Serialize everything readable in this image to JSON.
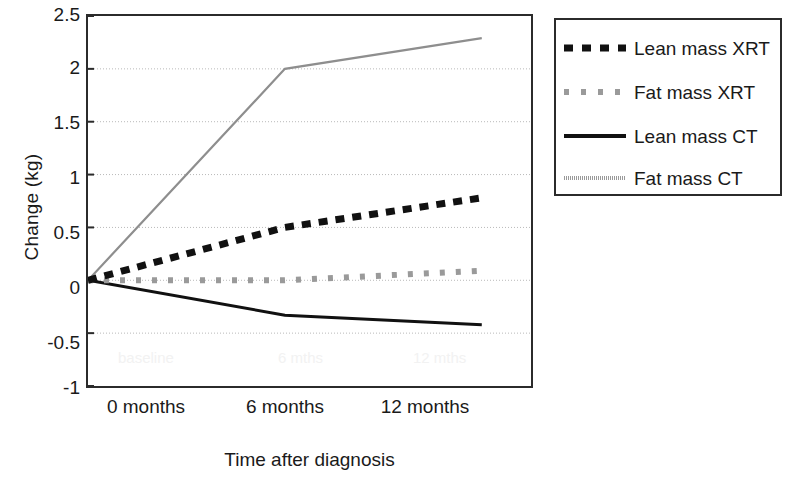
{
  "chart_data": {
    "type": "line",
    "title": "",
    "xlabel": "Time after diagnosis",
    "ylabel": "Change (kg)",
    "x": [
      0,
      6,
      12
    ],
    "categories": [
      "0 months",
      "6 months",
      "12 months"
    ],
    "xtick_labels": [
      "0 months",
      "6 months",
      "12 months"
    ],
    "ytick_labels": [
      "2.5",
      "2",
      "1.5",
      "1",
      "0.5",
      "0",
      "-0.5",
      "-1"
    ],
    "ytick_values": [
      2.5,
      2,
      1.5,
      1,
      0.5,
      0,
      -0.5,
      -1
    ],
    "ylim": [
      -1,
      2.5
    ],
    "xlim": [
      0,
      13.5
    ],
    "grid": "horizontal-dotted",
    "legend_position": "outside-right-top",
    "series": [
      {
        "name": "Lean mass XRT",
        "style": "dashed",
        "color": "#111111",
        "values": [
          0,
          0.5,
          0.78
        ]
      },
      {
        "name": "Fat mass XRT",
        "style": "dotted",
        "color": "#9a9a9a",
        "values": [
          0,
          0.0,
          0.09
        ]
      },
      {
        "name": "Lean mass CT",
        "style": "solid",
        "color": "#111111",
        "values": [
          0,
          -0.33,
          -0.42
        ]
      },
      {
        "name": "Fat mass CT",
        "style": "solid-thin-gray",
        "color": "#8e8e8e",
        "values": [
          0,
          2.0,
          2.29
        ]
      }
    ],
    "ghost_labels": [
      "baseline",
      "6 mths",
      "12 mths"
    ]
  },
  "axes": {
    "y_title": "Change (kg)",
    "x_title": "Time after diagnosis",
    "y_ticks": [
      "2.5",
      "2",
      "1.5",
      "1",
      "0.5",
      "0",
      "-0.5",
      "-1"
    ],
    "x_ticks": [
      "0 months",
      "6 months",
      "12 months"
    ]
  },
  "legend": {
    "items": [
      {
        "label": "Lean mass XRT",
        "marker": "dashed-black-swatch"
      },
      {
        "label": "Fat mass XRT",
        "marker": "dotted-gray-swatch"
      },
      {
        "label": "Lean mass CT",
        "marker": "solid-black-swatch"
      },
      {
        "label": "Fat mass CT",
        "marker": "solid-gray-swatch"
      }
    ]
  },
  "ghost": {
    "items": [
      "baseline",
      "6 mths",
      "12 mths"
    ]
  }
}
